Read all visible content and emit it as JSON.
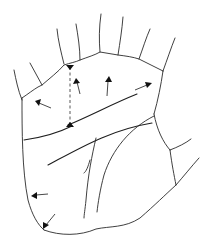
{
  "diagram": {
    "stroke_color": "#2a2a2a",
    "background": "#ffffff",
    "labels": [],
    "arrows": [
      {
        "name": "arrow-index-mount",
        "from": [
          80,
          94
        ],
        "to": [
          76,
          80
        ]
      },
      {
        "name": "arrow-middle-mount",
        "from": [
          107,
          96
        ],
        "to": [
          109,
          78
        ]
      },
      {
        "name": "arrow-ring-mount",
        "from": [
          136,
          89
        ],
        "to": [
          150,
          84
        ]
      },
      {
        "name": "arrow-upper-left",
        "from": [
          51,
          108
        ],
        "to": [
          36,
          101
        ]
      },
      {
        "name": "arrow-lower-left",
        "from": [
          48,
          194
        ],
        "to": [
          33,
          196
        ]
      },
      {
        "name": "arrow-bottom-left",
        "from": [
          55,
          214
        ],
        "to": [
          43,
          228
        ]
      }
    ],
    "dashed_line": {
      "from": [
        70,
        67
      ],
      "to": [
        70,
        127
      ]
    }
  }
}
